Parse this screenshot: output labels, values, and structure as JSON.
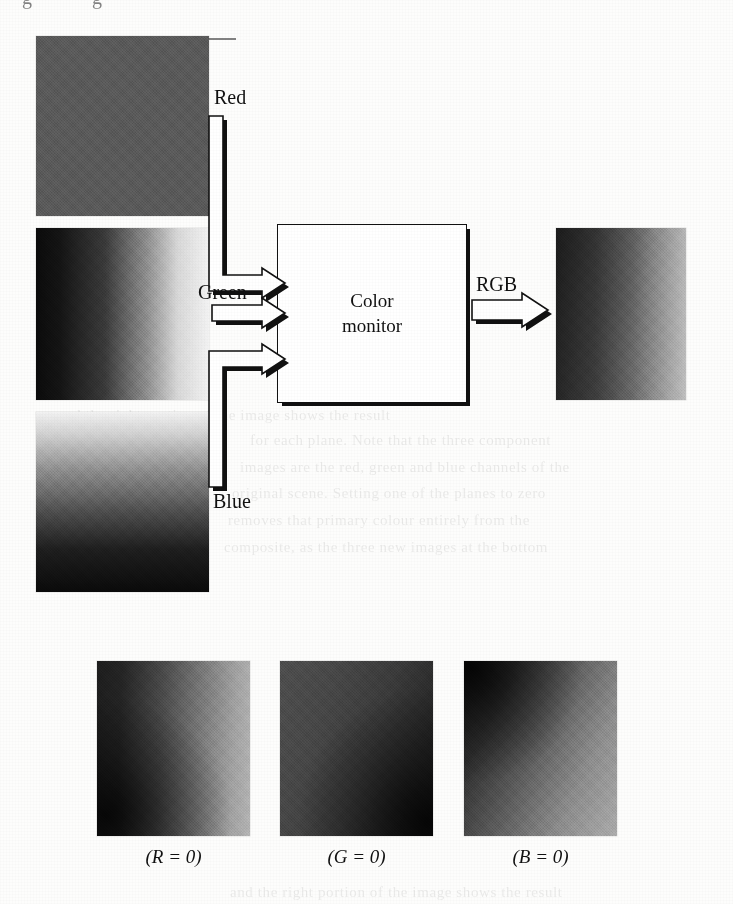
{
  "figure": {
    "type": "block-diagram"
  },
  "diagram": {
    "monitor_box": {
      "label": "Color\nmonitor",
      "name": "color-monitor-block"
    },
    "input_arrows": [
      {
        "id": "red",
        "label": "Red",
        "direction": "right",
        "shape": "elbow-down"
      },
      {
        "id": "green",
        "label": "Green",
        "direction": "right",
        "shape": "straight"
      },
      {
        "id": "blue",
        "label": "Blue",
        "direction": "right",
        "shape": "elbow-up"
      }
    ],
    "output_arrows": [
      {
        "id": "rgb",
        "label": "RGB",
        "direction": "right",
        "shape": "straight"
      }
    ]
  },
  "channel_images": [
    {
      "id": "red",
      "alt": "Red component image",
      "pattern": "uniform mid gray",
      "tone": "#5a5a5a"
    },
    {
      "id": "green",
      "alt": "Green component image",
      "pattern": "horizontal gradient dark to light",
      "tone": "#0b0b0b-#f3f3f3"
    },
    {
      "id": "blue",
      "alt": "Blue component image",
      "pattern": "vertical gradient light to dark",
      "tone": "#f2f2f2-#0a0a0a"
    }
  ],
  "output_image": {
    "id": "rgb",
    "alt": "Composite RGB image shown on the color monitor",
    "pattern": "gradient dark left to light right"
  },
  "bottom_row": {
    "items": [
      {
        "id": "r0",
        "caption": "(R = 0)",
        "channel": "R",
        "value": "0",
        "alt": "Composite image with the red component set to zero"
      },
      {
        "id": "g0",
        "caption": "(G = 0)",
        "channel": "G",
        "value": "0",
        "alt": "Composite image with the green component set to zero"
      },
      {
        "id": "b0",
        "caption": "(B = 0)",
        "channel": "B",
        "value": "0",
        "alt": "Composite image with the blue component set to zero"
      }
    ]
  },
  "page_artifacts": {
    "top_descenders": "gg",
    "bleed_lines": [
      "and the right portion of the image shows the result",
      "for each plane. Note that the three component",
      "images are the red, green and blue channels of the",
      "original scene. Setting one of the planes to zero",
      "removes that primary colour entirely from the",
      "composite, as the three new images at the bottom"
    ]
  },
  "colors": {
    "ink": "#111111",
    "paper": "#fdfdfc",
    "red_swatch": "#5a5a5a"
  }
}
